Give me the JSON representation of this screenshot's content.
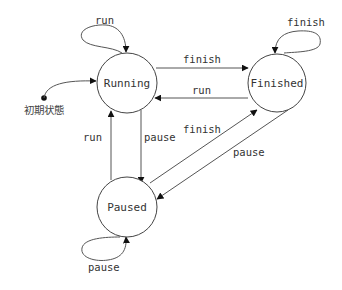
{
  "diagram": {
    "type": "state-machine",
    "initial_state_label": "初期状態",
    "states": [
      {
        "id": "running",
        "label": "Running"
      },
      {
        "id": "finished",
        "label": "Finished"
      },
      {
        "id": "paused",
        "label": "Paused"
      }
    ],
    "transitions": [
      {
        "from": "running",
        "to": "running",
        "label": "run"
      },
      {
        "from": "running",
        "to": "finished",
        "label": "finish"
      },
      {
        "from": "finished",
        "to": "running",
        "label": "run"
      },
      {
        "from": "finished",
        "to": "finished",
        "label": "finish"
      },
      {
        "from": "running",
        "to": "paused",
        "label": "pause"
      },
      {
        "from": "paused",
        "to": "running",
        "label": "run"
      },
      {
        "from": "paused",
        "to": "finished",
        "label": "finish"
      },
      {
        "from": "finished",
        "to": "paused",
        "label": "pause"
      },
      {
        "from": "paused",
        "to": "paused",
        "label": "pause"
      }
    ]
  },
  "colors": {
    "stroke": "#444444",
    "text": "#333333",
    "background": "#ffffff"
  }
}
